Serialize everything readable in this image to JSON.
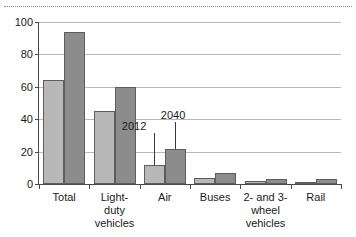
{
  "chart_data": {
    "type": "bar",
    "title": "",
    "xlabel": "",
    "ylabel": "",
    "ylim": [
      0,
      100
    ],
    "yticks": [
      0,
      20,
      40,
      60,
      80,
      100
    ],
    "grid": true,
    "legend_position": "none",
    "categories": [
      "Total",
      "Light-duty vehicles",
      "Air",
      "Buses",
      "2- and 3-wheel vehicles",
      "Rail"
    ],
    "category_lines": [
      [
        "Total"
      ],
      [
        "Light-",
        "duty",
        "vehicles"
      ],
      [
        "Air"
      ],
      [
        "Buses"
      ],
      [
        "2- and 3-",
        "wheel",
        "vehicles"
      ],
      [
        "Rail"
      ]
    ],
    "series": [
      {
        "name": "2012",
        "color": "#b8b8b8",
        "values": [
          64,
          45,
          12,
          4,
          2,
          1
        ]
      },
      {
        "name": "2040",
        "color": "#8c8c8c",
        "values": [
          94,
          60,
          21.5,
          7,
          3,
          3
        ]
      }
    ],
    "annotations": [
      {
        "text": "2012",
        "points_to_series": "2012",
        "points_to_category": "Air"
      },
      {
        "text": "2040",
        "points_to_series": "2040",
        "points_to_category": "Air"
      }
    ]
  },
  "axis": {
    "ytick_labels": [
      "100",
      "80",
      "60",
      "40",
      "20",
      "0"
    ]
  }
}
